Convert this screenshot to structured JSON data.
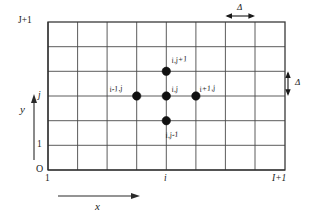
{
  "figure": {
    "kind": "finite-difference-grid-stencil",
    "colors": {
      "background": "#ffffff",
      "grid_line": "#4a4a4a",
      "grid_frame": "#3a3a3a",
      "axis": "#2a2a2a",
      "node_dot": "#111111",
      "text": "#1a1a1a"
    }
  },
  "grid": {
    "columns": 8,
    "rows": 6,
    "left": 48,
    "right": 285,
    "top": 22,
    "bottom": 170
  },
  "axes": {
    "x": {
      "name": "x",
      "ticks": [
        {
          "label": "1",
          "column_index": 0
        },
        {
          "label": "i",
          "column_index": 4
        },
        {
          "label": "I+1",
          "column_index": 8
        }
      ]
    },
    "y": {
      "name": "y",
      "ticks": [
        {
          "label": "J+1",
          "row_index": 6
        },
        {
          "label": "j",
          "row_index": 3
        },
        {
          "label": "1",
          "row_index": 1
        }
      ]
    },
    "origin_label": "O"
  },
  "spacing": {
    "horizontal_label": "Δ",
    "vertical_label": "Δ"
  },
  "stencil": {
    "nodes": [
      {
        "id": "north",
        "label": "i,j+1",
        "col": 4,
        "row": 4
      },
      {
        "id": "west",
        "label": "i-1,j",
        "col": 3,
        "row": 3
      },
      {
        "id": "center",
        "label": "i,j",
        "col": 4,
        "row": 3
      },
      {
        "id": "east",
        "label": "i+1,j",
        "col": 5,
        "row": 3
      },
      {
        "id": "south",
        "label": "i,j-1",
        "col": 4,
        "row": 2
      }
    ]
  }
}
